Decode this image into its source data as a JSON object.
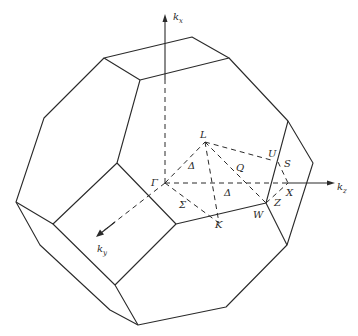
{
  "figure": {
    "type": "Brillouin zone of face-centered cubic lattice (truncated octahedron)",
    "axes": [
      {
        "id": "kx",
        "label": "k",
        "subscript": "x"
      },
      {
        "id": "ky",
        "label": "k",
        "subscript": "y"
      },
      {
        "id": "kz",
        "label": "k",
        "subscript": "z"
      }
    ],
    "points": [
      {
        "id": "Gamma",
        "label": "Γ"
      },
      {
        "id": "L",
        "label": "L"
      },
      {
        "id": "U",
        "label": "U"
      },
      {
        "id": "S",
        "label": "S"
      },
      {
        "id": "X",
        "label": "X"
      },
      {
        "id": "Z",
        "label": "Z"
      },
      {
        "id": "W",
        "label": "W"
      },
      {
        "id": "K",
        "label": "K"
      },
      {
        "id": "Q",
        "label": "Q"
      },
      {
        "id": "Lambda",
        "label": "Δ"
      },
      {
        "id": "Delta",
        "label": "Δ"
      },
      {
        "id": "Sigma",
        "label": "Σ"
      }
    ]
  }
}
